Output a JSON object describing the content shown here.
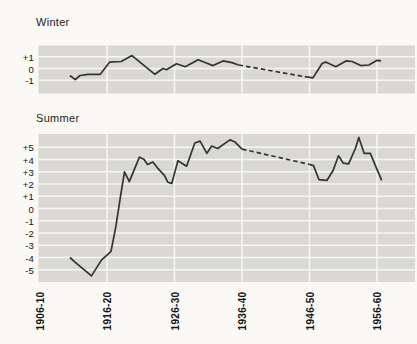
{
  "palette": {
    "page_bg": "#faf9f6",
    "panel_bg": "#d9d8d4",
    "grid_line": "#f7f6f3",
    "data_line": "#333333",
    "text": "#1b1b1b"
  },
  "x_axis": {
    "tick_labels": [
      "1906-10",
      "1916-20",
      "1926-30",
      "1936-40",
      "1946-50",
      "1956-60"
    ],
    "tick_years": [
      1908,
      1918,
      1928,
      1938,
      1948,
      1958
    ],
    "xlim_years": [
      1907.85,
      1963.6
    ]
  },
  "chart_data": [
    {
      "type": "line",
      "title": "Winter",
      "ylim": [
        -2.15,
        2.0
      ],
      "yticks": [
        {
          "v": 1,
          "label": "+1"
        },
        {
          "v": 0,
          "label": "0"
        },
        {
          "v": -1,
          "label": "-1"
        }
      ],
      "series": [
        {
          "name": "winter-anomaly",
          "segments": [
            {
              "style": "solid",
              "points": [
                [
                  1912.5,
                  -0.6
                ],
                [
                  1913.3,
                  -0.95
                ],
                [
                  1914.0,
                  -0.6
                ],
                [
                  1915.2,
                  -0.5
                ],
                [
                  1917.0,
                  -0.5
                ],
                [
                  1918.4,
                  0.55
                ],
                [
                  1920.1,
                  0.6
                ],
                [
                  1921.7,
                  1.1
                ],
                [
                  1925.1,
                  -0.5
                ],
                [
                  1926.3,
                  0.0
                ],
                [
                  1926.8,
                  -0.1
                ],
                [
                  1928.3,
                  0.4
                ],
                [
                  1929.6,
                  0.15
                ],
                [
                  1931.5,
                  0.75
                ],
                [
                  1932.8,
                  0.45
                ],
                [
                  1933.7,
                  0.25
                ],
                [
                  1935.2,
                  0.65
                ],
                [
                  1936.5,
                  0.5
                ],
                [
                  1937.5,
                  0.3
                ]
              ]
            },
            {
              "style": "dashed",
              "points": [
                [
                  1937.5,
                  0.3
                ],
                [
                  1947.3,
                  -0.7
                ]
              ]
            },
            {
              "style": "solid",
              "points": [
                [
                  1947.3,
                  -0.7
                ],
                [
                  1948.5,
                  -0.8
                ],
                [
                  1949.9,
                  0.45
                ],
                [
                  1950.4,
                  0.55
                ],
                [
                  1951.9,
                  0.15
                ],
                [
                  1953.4,
                  0.65
                ],
                [
                  1954.3,
                  0.6
                ],
                [
                  1955.6,
                  0.25
                ],
                [
                  1956.8,
                  0.3
                ],
                [
                  1958.0,
                  0.7
                ],
                [
                  1958.6,
                  0.65
                ]
              ]
            }
          ]
        }
      ]
    },
    {
      "type": "line",
      "title": "Summer",
      "ylim": [
        -6.1,
        6.1
      ],
      "yticks": [
        {
          "v": 5,
          "label": "+5"
        },
        {
          "v": 4,
          "label": "+4"
        },
        {
          "v": 3,
          "label": "+3"
        },
        {
          "v": 2,
          "label": "+2"
        },
        {
          "v": 1,
          "label": "+1"
        },
        {
          "v": 0,
          "label": "0"
        },
        {
          "v": -1,
          "label": "-1"
        },
        {
          "v": -2,
          "label": "-2"
        },
        {
          "v": -3,
          "label": "-3"
        },
        {
          "v": -4,
          "label": "-4"
        },
        {
          "v": -5,
          "label": "-5"
        }
      ],
      "series": [
        {
          "name": "summer-anomaly",
          "segments": [
            {
              "style": "solid",
              "points": [
                [
                  1912.5,
                  -4.0
                ],
                [
                  1913.3,
                  -4.4
                ],
                [
                  1915.7,
                  -5.5
                ],
                [
                  1917.2,
                  -4.2
                ],
                [
                  1918.0,
                  -3.8
                ],
                [
                  1918.6,
                  -3.5
                ],
                [
                  1919.3,
                  -1.5
                ],
                [
                  1920.0,
                  1.0
                ],
                [
                  1920.6,
                  3.0
                ],
                [
                  1921.3,
                  2.2
                ],
                [
                  1922.8,
                  4.2
                ],
                [
                  1923.5,
                  4.0
                ],
                [
                  1924.0,
                  3.6
                ],
                [
                  1924.8,
                  3.8
                ],
                [
                  1925.5,
                  3.3
                ],
                [
                  1926.5,
                  2.7
                ],
                [
                  1927.0,
                  2.15
                ],
                [
                  1927.6,
                  2.05
                ],
                [
                  1928.5,
                  3.9
                ],
                [
                  1929.8,
                  3.45
                ],
                [
                  1931.0,
                  5.35
                ],
                [
                  1931.8,
                  5.5
                ],
                [
                  1932.8,
                  4.5
                ],
                [
                  1933.5,
                  5.1
                ],
                [
                  1934.4,
                  4.9
                ],
                [
                  1936.2,
                  5.6
                ],
                [
                  1936.9,
                  5.45
                ],
                [
                  1938.0,
                  4.85
                ]
              ]
            },
            {
              "style": "dashed",
              "points": [
                [
                  1938.0,
                  4.85
                ],
                [
                  1948.0,
                  3.6
                ]
              ]
            },
            {
              "style": "solid",
              "points": [
                [
                  1948.0,
                  3.6
                ],
                [
                  1948.6,
                  3.5
                ],
                [
                  1949.4,
                  2.35
                ],
                [
                  1950.6,
                  2.3
                ],
                [
                  1951.5,
                  3.1
                ],
                [
                  1952.3,
                  4.3
                ],
                [
                  1953.0,
                  3.7
                ],
                [
                  1953.8,
                  3.65
                ],
                [
                  1954.8,
                  4.9
                ],
                [
                  1955.3,
                  5.8
                ],
                [
                  1956.1,
                  4.5
                ],
                [
                  1957.0,
                  4.5
                ],
                [
                  1958.0,
                  3.2
                ],
                [
                  1958.7,
                  2.3
                ]
              ]
            }
          ]
        }
      ]
    }
  ]
}
